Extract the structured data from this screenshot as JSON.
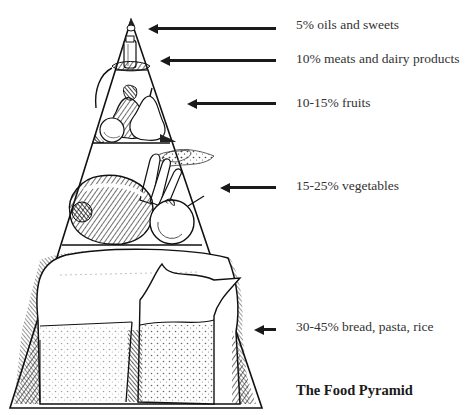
{
  "diagram": {
    "title": "The Food Pyramid",
    "tiers": [
      {
        "id": "oils-sweets",
        "label": "5% oils and sweets",
        "illustration": "oil-bottle-icon"
      },
      {
        "id": "meats-dairy",
        "label": "10% meats and dairy products",
        "illustration": "milk-bottle-icon"
      },
      {
        "id": "fruits",
        "label": "10-15% fruits",
        "illustration": "pears-apple-icon"
      },
      {
        "id": "vegetables",
        "label": "15-25% vegetables",
        "illustration": "pepper-carrots-icon"
      },
      {
        "id": "grains",
        "label": "30-45% bread, pasta, rice",
        "illustration": "bread-rice-bag-icon"
      }
    ],
    "colors": {
      "ink": "#1a1a1a",
      "text": "#333333",
      "background": "#ffffff"
    }
  }
}
